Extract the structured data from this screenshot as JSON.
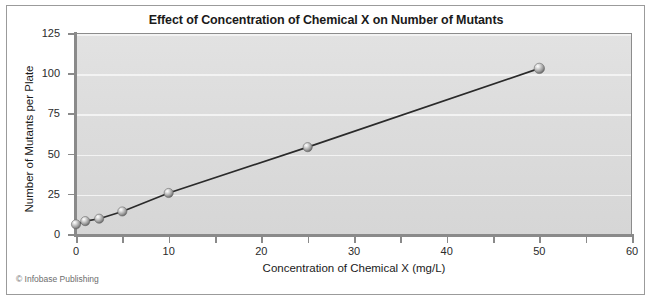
{
  "figure": {
    "credit": "© Infobase Publishing",
    "background_color": "#ffffff",
    "plot_background_color": "#dcdcdc",
    "gridline_color": "#f3f3f3",
    "axis_color": "#8a8a8a",
    "line_color": "#2a2a2a",
    "marker_color": "#a8a8a8"
  },
  "chart_data": {
    "type": "line",
    "title": "Effect of Concentration of Chemical X on Number of Mutants",
    "xlabel": "Concentration of Chemical X (mg/L)",
    "ylabel": "Number of Mutants per Plate",
    "xlim": [
      0,
      60
    ],
    "ylim": [
      0,
      125
    ],
    "x_ticks": [
      0,
      10,
      20,
      30,
      40,
      50,
      60
    ],
    "x_tick_labels": [
      "0",
      "10",
      "20",
      "30",
      "40",
      "50",
      "60"
    ],
    "x_minor_ticks": [
      5,
      15,
      25,
      35,
      45,
      55
    ],
    "y_ticks": [
      0,
      25,
      50,
      75,
      100,
      125
    ],
    "y_tick_labels": [
      "0",
      "25",
      "50",
      "75",
      "100",
      "125"
    ],
    "grid": "horizontal",
    "legend": "none",
    "series": [
      {
        "name": "Mutants per plate",
        "marker": "sphere",
        "x": [
          0,
          1,
          2.5,
          5,
          10,
          25,
          50
        ],
        "y": [
          6,
          8,
          9.5,
          14,
          25.5,
          54,
          103
        ]
      }
    ]
  }
}
